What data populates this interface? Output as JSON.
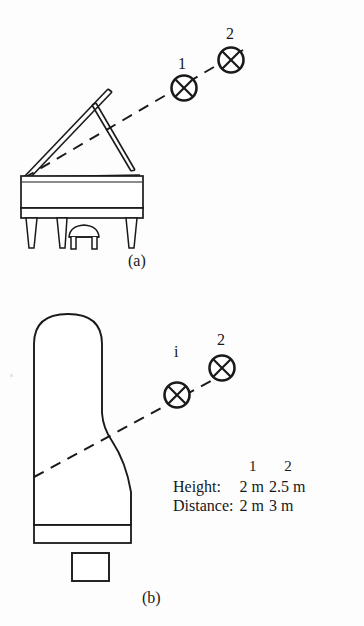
{
  "figure": {
    "panels": [
      {
        "id": "a",
        "caption": "(a)",
        "view": "side-elevation",
        "subject": "grand-piano",
        "mic_labels": [
          "1",
          "2"
        ]
      },
      {
        "id": "b",
        "caption": "(b)",
        "view": "plan",
        "subject": "grand-piano",
        "mic_labels": [
          "i",
          "2"
        ]
      }
    ]
  },
  "table": {
    "column_headers": [
      "1",
      "2"
    ],
    "rows": [
      {
        "label": "Height:",
        "values": [
          "2 m",
          "2.5 m"
        ]
      },
      {
        "label": "Distance:",
        "values": [
          "2 m",
          "3 m"
        ]
      }
    ]
  },
  "icons": {
    "microphone": "circle-x-microphone-icon",
    "axis": "dashed-axis-line"
  },
  "colors": {
    "ink": "#181818",
    "background": "#fdfdfd",
    "line": "#1a1a1a"
  }
}
